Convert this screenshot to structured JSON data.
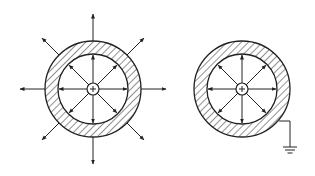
{
  "diagram": {
    "panels": [
      {
        "id": "ungrounded-shell",
        "center": [
          93,
          89
        ],
        "outer_radius": 48,
        "inner_radius": 35,
        "charge_radius": 6,
        "central_charge": "+",
        "inner_field_lines": 8,
        "outer_field_lines": 8,
        "grounded": false
      },
      {
        "id": "grounded-shell",
        "center": [
          242,
          89
        ],
        "outer_radius": 48,
        "inner_radius": 35,
        "charge_radius": 6,
        "central_charge": "+",
        "inner_field_lines": 8,
        "outer_field_lines": 0,
        "grounded": true
      }
    ],
    "colors": {
      "stroke": "#222222",
      "background": "#ffffff"
    }
  }
}
